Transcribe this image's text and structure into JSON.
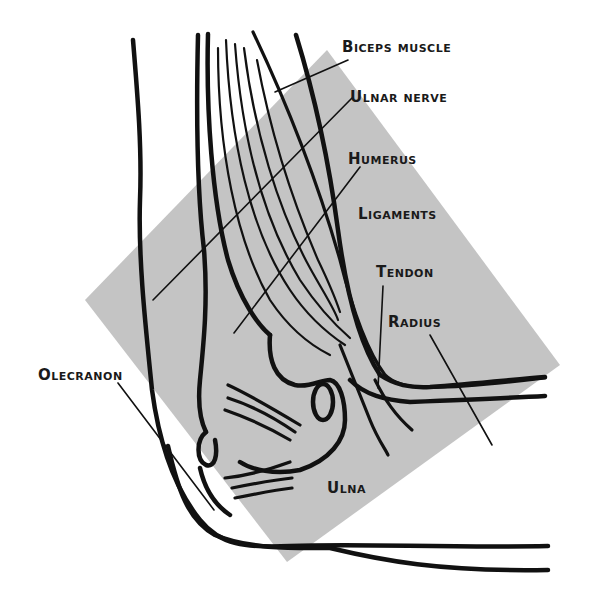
{
  "diagram": {
    "background_color": "#ffffff",
    "highlight_color": "#c4c4c4",
    "line_color": "#111111",
    "labels": [
      {
        "id": "biceps",
        "text": "Biceps muscle"
      },
      {
        "id": "ulnar_nerve",
        "text": "Ulnar nerve"
      },
      {
        "id": "humerus",
        "text": "Humerus"
      },
      {
        "id": "ligaments",
        "text": "Ligaments"
      },
      {
        "id": "tendon",
        "text": "Tendon"
      },
      {
        "id": "radius",
        "text": "Radius"
      },
      {
        "id": "olecranon",
        "text": "Olecranon"
      },
      {
        "id": "ulna",
        "text": "Ulna"
      }
    ]
  }
}
